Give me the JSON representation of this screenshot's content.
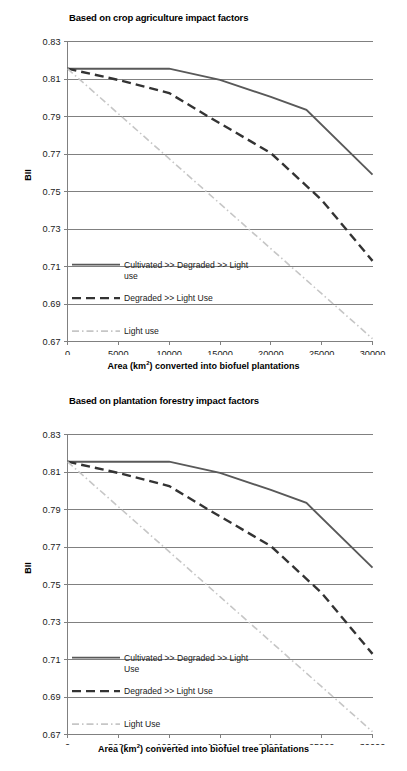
{
  "figures": [
    {
      "title": "Based on crop agriculture impact factors",
      "ylabel": "BII",
      "xlabel_pre": "Area (km",
      "xlabel_sup": "2",
      "xlabel_post": ") converted into biofuel plantations",
      "legend": [
        {
          "label_line1": "Cultivated >> Degraded >> Light",
          "label_line2": "use",
          "style": "solid"
        },
        {
          "label_line1": "Degraded >> Light Use",
          "label_line2": "",
          "style": "dashed"
        },
        {
          "label_line1": "Light use",
          "label_line2": "",
          "style": "dashdot"
        }
      ]
    },
    {
      "title": "Based on plantation forestry impact factors",
      "ylabel": "BII",
      "xlabel_pre": "Area (km",
      "xlabel_sup": "2",
      "xlabel_post": ") converted into biofuel tree plantations",
      "legend": [
        {
          "label_line1": "Cultivated >> Degraded >> Light",
          "label_line2": "Use",
          "style": "solid"
        },
        {
          "label_line1": "Degraded >> Light Use",
          "label_line2": "",
          "style": "dashed"
        },
        {
          "label_line1": "Light Use",
          "label_line2": "",
          "style": "dashdot"
        }
      ]
    }
  ],
  "colors": {
    "solid": "#595959",
    "dashed": "#333333",
    "dashdot": "#c6c6c6",
    "grid": "#808080",
    "axis": "#808080",
    "text": "#1a1a1a"
  },
  "chart_data": [
    {
      "type": "line",
      "title": "Based on crop agriculture impact factors",
      "xlabel": "Area (km2) converted into biofuel plantations",
      "ylabel": "BII",
      "xlim": [
        0,
        30000
      ],
      "ylim": [
        0.67,
        0.83
      ],
      "xticks": [
        0,
        5000,
        10000,
        15000,
        20000,
        25000,
        30000
      ],
      "yticks": [
        0.67,
        0.69,
        0.71,
        0.73,
        0.75,
        0.77,
        0.79,
        0.81,
        0.83
      ],
      "grid": true,
      "legend_position": "inside-lower-left",
      "series": [
        {
          "name": "Cultivated >> Degraded >> Light use",
          "style": "solid",
          "x": [
            0,
            10000,
            15000,
            20000,
            23500,
            30000
          ],
          "y": [
            0.8155,
            0.8155,
            0.8095,
            0.8005,
            0.7935,
            0.759
          ]
        },
        {
          "name": "Degraded >> Light Use",
          "style": "dashed",
          "x": [
            0,
            5000,
            10000,
            14000,
            20000,
            25000,
            30000
          ],
          "y": [
            0.8155,
            0.8095,
            0.8025,
            0.7895,
            0.7705,
            0.7455,
            0.713
          ]
        },
        {
          "name": "Light use",
          "style": "dashdot",
          "x": [
            0,
            5000,
            10000,
            15000,
            20000,
            25000,
            30000
          ],
          "y": [
            0.8155,
            0.7915,
            0.7675,
            0.7435,
            0.7195,
            0.6955,
            0.6715
          ]
        }
      ]
    },
    {
      "type": "line",
      "title": "Based on plantation forestry impact factors",
      "xlabel": "Area (km2) converted into biofuel tree plantations",
      "ylabel": "BII",
      "xlim": [
        0,
        30000
      ],
      "ylim": [
        0.67,
        0.83
      ],
      "xticks": [
        0,
        5000,
        10000,
        15000,
        20000,
        25000,
        30000
      ],
      "yticks": [
        0.67,
        0.69,
        0.71,
        0.73,
        0.75,
        0.77,
        0.79,
        0.81,
        0.83
      ],
      "grid": true,
      "legend_position": "inside-lower-left",
      "series": [
        {
          "name": "Cultivated >> Degraded >> Light Use",
          "style": "solid",
          "x": [
            0,
            10000,
            15000,
            20000,
            23500,
            30000
          ],
          "y": [
            0.8155,
            0.8155,
            0.8095,
            0.8005,
            0.7935,
            0.759
          ]
        },
        {
          "name": "Degraded >> Light Use",
          "style": "dashed",
          "x": [
            0,
            5000,
            10000,
            14000,
            20000,
            25000,
            30000
          ],
          "y": [
            0.8155,
            0.8095,
            0.8025,
            0.7895,
            0.7705,
            0.7455,
            0.713
          ]
        },
        {
          "name": "Light Use",
          "style": "dashdot",
          "x": [
            0,
            5000,
            10000,
            15000,
            20000,
            25000,
            30000
          ],
          "y": [
            0.8155,
            0.7915,
            0.7675,
            0.7435,
            0.7195,
            0.6955,
            0.6715
          ]
        }
      ]
    }
  ]
}
